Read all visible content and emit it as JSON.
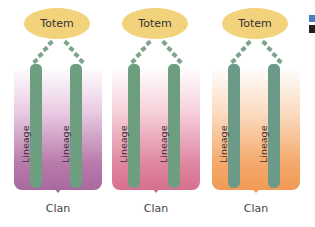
{
  "diagram": {
    "panels": [
      {
        "totem_label": "Totem",
        "lineage_labels": [
          "Lineage",
          "Lineage"
        ],
        "clan_label": "Clan",
        "color": "#a86a9e",
        "gradient_from": "#ffffff",
        "gradient_to": "#a86a9e"
      },
      {
        "totem_label": "Totem",
        "lineage_labels": [
          "Lineage",
          "Lineage"
        ],
        "clan_label": "Clan",
        "color": "#d7708f",
        "gradient_from": "#ffffff",
        "gradient_to": "#d7708f"
      },
      {
        "totem_label": "Totem",
        "lineage_labels": [
          "Lineage",
          "Lineage"
        ],
        "clan_label": "Clan",
        "color": "#f29a55",
        "gradient_from": "#ffffff",
        "gradient_to": "#f29a55"
      }
    ],
    "colors": {
      "totem_fill": "#f2d27a",
      "lineage_bar": "#6c9e7f",
      "dash_connector": "#7fa48c"
    }
  }
}
